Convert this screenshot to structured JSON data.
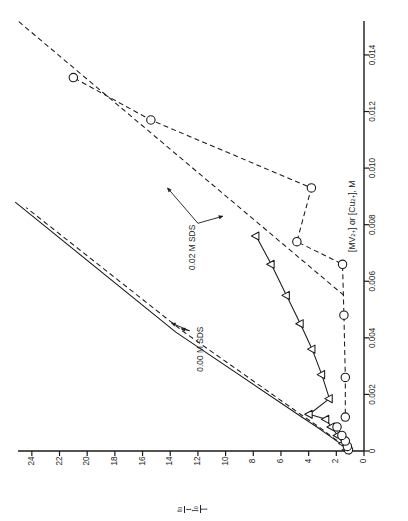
{
  "figure": {
    "orientation": "rotated-90-ccw",
    "background": "#ffffff",
    "ink_color": "#1a1a1a"
  },
  "chart_data": {
    "type": "scatter",
    "title": "",
    "subtitle": "",
    "xlabel": "[MV2+] or [Cu2+], M",
    "xlabel_parts": {
      "open1": "[MV",
      "sup1": "2+",
      "close1": "] or [Cu",
      "sup2": "2+",
      "close2": "], M"
    },
    "ylabel": "I0/I , t0/t",
    "ylabel_parts": {
      "line1_num": "t",
      "line1_num_sub": "0",
      "line1_den": "t",
      "line2_num": "I",
      "line2_num_sub": "0",
      "line2_den": "I"
    },
    "xlim": [
      0,
      0.0152
    ],
    "ylim": [
      0,
      25
    ],
    "xticks": [
      0,
      0.002,
      0.004,
      0.006,
      0.008,
      0.01,
      0.012,
      0.014
    ],
    "xtick_labels": [
      "0",
      "0.002",
      "0.004",
      "0.006",
      "0.008",
      "0.010",
      "0.012",
      "0.014"
    ],
    "yticks": [
      0,
      2,
      4,
      6,
      8,
      10,
      12,
      14,
      16,
      18,
      20,
      22,
      24
    ],
    "ytick_labels": [
      "0",
      "2",
      "4",
      "6",
      "8",
      "10",
      "12",
      "14",
      "16",
      "18",
      "20",
      "22",
      "24"
    ],
    "grid": false,
    "legend": "none",
    "annotations": [
      {
        "text": "0.02 M SDS",
        "x": 0.0072,
        "y": 12.4
      },
      {
        "text": "0.00 M SDS",
        "x": 0.0036,
        "y": 11.8
      }
    ],
    "series": [
      {
        "name": "0.00 M SDS - intensity (solid line, no markers)",
        "marker": "none",
        "linestyle": "solid",
        "x": [
          0.0,
          0.00028,
          0.00055,
          0.00085,
          0.0012,
          0.0042,
          0.0088
        ],
        "y": [
          1.0,
          1.75,
          2.55,
          3.4,
          4.5,
          13.6,
          25.2
        ]
      },
      {
        "name": "0.00 M SDS - lifetime (dashed line, no markers)",
        "marker": "none",
        "linestyle": "dashed",
        "x": [
          0.0,
          0.00028,
          0.00055,
          0.00085,
          0.0012,
          0.0042,
          0.0086
        ],
        "y": [
          1.0,
          1.7,
          2.45,
          3.25,
          4.3,
          13.0,
          24.4
        ]
      },
      {
        "name": "0.02 M SDS - MV2+ (open triangles, solid line)",
        "marker": "triangle-left-open",
        "linestyle": "solid",
        "x": [
          4e-05,
          0.00026,
          0.00055,
          0.00085,
          0.00112,
          0.0013,
          0.00185,
          0.0027,
          0.0036,
          0.0045,
          0.0055,
          0.0066,
          0.0076
        ],
        "y": [
          1.25,
          1.5,
          1.9,
          2.35,
          2.75,
          3.95,
          2.5,
          3.05,
          3.75,
          4.6,
          5.6,
          6.7,
          7.8
        ]
      },
      {
        "name": "0.02 M SDS - Cu2+ (open circles, dashed line)",
        "marker": "circle-open",
        "linestyle": "dashed",
        "x": [
          4e-05,
          0.00016,
          0.00035,
          0.00055,
          0.00085,
          0.0012,
          0.0026,
          0.0048,
          0.0066,
          0.0074,
          0.0093,
          0.0117,
          0.0132
        ],
        "y": [
          1.12,
          1.2,
          1.35,
          1.6,
          1.95,
          1.35,
          1.35,
          1.45,
          1.55,
          4.85,
          3.8,
          15.4,
          21.0
        ]
      },
      {
        "name": "0.02 M SDS - Cu2+ fit (long dashed line)",
        "marker": "none",
        "linestyle": "dashed",
        "x": [
          0.0055,
          0.0152
        ],
        "y": [
          1.45,
          25.0
        ]
      }
    ]
  },
  "axes": {
    "x_axis_name": "concentration-axis",
    "y_axis_name": "quenching-ratio-axis"
  }
}
